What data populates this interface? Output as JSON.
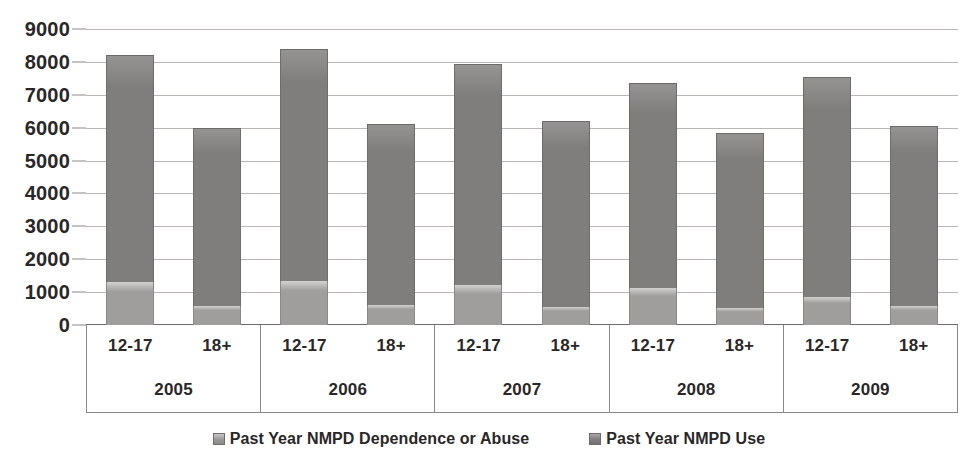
{
  "chart_data": {
    "type": "bar",
    "stacked": true,
    "title": "",
    "subtitle": "",
    "xlabel": "",
    "ylabel": "",
    "ylim": [
      0,
      9000
    ],
    "ytick_step": 1000,
    "yticks": [
      "9000",
      "8000",
      "7000",
      "6000",
      "5000",
      "4000",
      "3000",
      "2000",
      "1000",
      "0"
    ],
    "grid": true,
    "legend_position": "bottom",
    "group_labels": [
      "2005",
      "2006",
      "2007",
      "2008",
      "2009"
    ],
    "subgroup_labels": [
      "12-17",
      "18+"
    ],
    "categories": [
      "2005 12-17",
      "2005 18+",
      "2006 12-17",
      "2006 18+",
      "2007 12-17",
      "2007 18+",
      "2008 12-17",
      "2008 18+",
      "2009 12-17",
      "2009 18+"
    ],
    "series": [
      {
        "name": "Past Year NMPD Dependence or Abuse",
        "color": "#9b9997",
        "values": [
          1300,
          580,
          1330,
          600,
          1210,
          560,
          1120,
          520,
          860,
          570
        ]
      },
      {
        "name": "Past Year NMPD Use",
        "color": "#807e7d",
        "values": [
          6900,
          5420,
          7070,
          5520,
          6740,
          5640,
          6230,
          5330,
          6690,
          5480
        ]
      }
    ],
    "totals": [
      8200,
      6000,
      8400,
      6120,
      7950,
      6200,
      7350,
      5850,
      7550,
      6050
    ]
  },
  "legend": {
    "items": [
      {
        "label": "Past Year NMPD Dependence or Abuse",
        "swatch": "legend-swatch-icon"
      },
      {
        "label": "Past Year NMPD Use",
        "swatch": "legend-swatch-icon"
      }
    ]
  }
}
